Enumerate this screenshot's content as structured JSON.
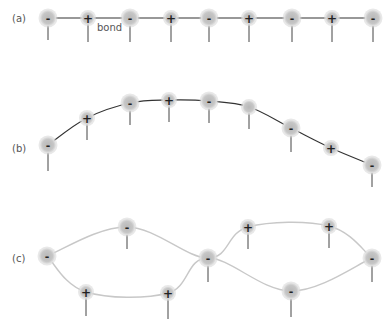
{
  "colors": {
    "atom_fill": "#c4c4c4",
    "atom_glow": "#d9d9d9",
    "bond_dark": "#333333",
    "bond_light": "#c8c8c8",
    "stem": "#444444",
    "label": "#555555"
  },
  "panels": [
    {
      "id": "a",
      "label": "(a)",
      "label_pos": [
        12,
        22
      ],
      "bond_style": "dark",
      "bond_label": {
        "text": "bond",
        "pos": [
          97,
          31
        ]
      },
      "chains": [
        [
          [
            48,
            18
          ],
          [
            88,
            18
          ],
          [
            130,
            18
          ],
          [
            171,
            18
          ],
          [
            209,
            18
          ],
          [
            249,
            18
          ],
          [
            292,
            18
          ],
          [
            332,
            18
          ],
          [
            373,
            18
          ]
        ]
      ],
      "atoms": [
        {
          "x": 48,
          "y": 18,
          "sign": "-",
          "stem": 22
        },
        {
          "x": 88,
          "y": 18,
          "sign": "+",
          "stem": 24
        },
        {
          "x": 130,
          "y": 18,
          "sign": "-",
          "stem": 24
        },
        {
          "x": 171,
          "y": 18,
          "sign": "+",
          "stem": 24
        },
        {
          "x": 209,
          "y": 18,
          "sign": "-",
          "stem": 24
        },
        {
          "x": 249,
          "y": 18,
          "sign": "+",
          "stem": 24
        },
        {
          "x": 292,
          "y": 18,
          "sign": "-",
          "stem": 24
        },
        {
          "x": 332,
          "y": 18,
          "sign": "+",
          "stem": 24
        },
        {
          "x": 373,
          "y": 18,
          "sign": "-",
          "stem": 24
        }
      ]
    },
    {
      "id": "b",
      "label": "(b)",
      "label_pos": [
        12,
        152
      ],
      "bond_style": "dark",
      "chains": [
        [
          [
            48,
            145
          ],
          [
            87,
            118
          ],
          [
            130,
            103
          ],
          [
            169,
            100
          ],
          [
            209,
            101
          ],
          [
            249,
            107
          ],
          [
            291,
            128
          ],
          [
            331,
            148
          ],
          [
            372,
            165
          ]
        ]
      ],
      "atoms": [
        {
          "x": 48,
          "y": 145,
          "sign": "-",
          "stem": 26
        },
        {
          "x": 87,
          "y": 118,
          "sign": "+",
          "stem": 22
        },
        {
          "x": 130,
          "y": 103,
          "sign": "-",
          "stem": 22
        },
        {
          "x": 169,
          "y": 100,
          "sign": "+",
          "stem": 22
        },
        {
          "x": 209,
          "y": 101,
          "sign": "-",
          "stem": 22
        },
        {
          "x": 249,
          "y": 107,
          "sign": "",
          "stem": 22
        },
        {
          "x": 291,
          "y": 128,
          "sign": "-",
          "stem": 24
        },
        {
          "x": 331,
          "y": 148,
          "sign": "+",
          "stem": 0
        },
        {
          "x": 372,
          "y": 165,
          "sign": "-",
          "stem": 22
        }
      ]
    },
    {
      "id": "c",
      "label": "(c)",
      "label_pos": [
        12,
        262
      ],
      "bond_style": "light",
      "chains": [
        [
          [
            47,
            256
          ],
          [
            127,
            227
          ],
          [
            208,
            258
          ],
          [
            248,
            227
          ],
          [
            329,
            226
          ],
          [
            372,
            258
          ]
        ],
        [
          [
            47,
            256
          ],
          [
            86,
            292
          ],
          [
            168,
            293
          ],
          [
            208,
            258
          ],
          [
            291,
            291
          ],
          [
            372,
            258
          ]
        ]
      ],
      "atoms": [
        {
          "x": 47,
          "y": 256,
          "sign": "-",
          "stem": 0
        },
        {
          "x": 127,
          "y": 227,
          "sign": "-",
          "stem": 22
        },
        {
          "x": 208,
          "y": 258,
          "sign": "-",
          "stem": 24
        },
        {
          "x": 248,
          "y": 227,
          "sign": "+",
          "stem": 22
        },
        {
          "x": 329,
          "y": 226,
          "sign": "+",
          "stem": 22
        },
        {
          "x": 372,
          "y": 258,
          "sign": "-",
          "stem": 24
        },
        {
          "x": 86,
          "y": 292,
          "sign": "+",
          "stem": 24
        },
        {
          "x": 168,
          "y": 293,
          "sign": "+",
          "stem": 26
        },
        {
          "x": 291,
          "y": 291,
          "sign": "-",
          "stem": 26
        }
      ]
    }
  ]
}
